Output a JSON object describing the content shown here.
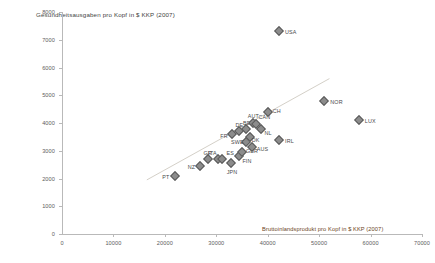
{
  "chart_data": {
    "type": "scatter",
    "title": "Gesundheitsausgaben pro Kopf in $ KKP (2007)",
    "xlabel": "Bruttoinlandsprodukt pro Kopf in $ KKP (2007)",
    "ylabel": "Gesundheitsausgaben pro Kopf in $ KKP (2007)",
    "xlim": [
      0,
      70000
    ],
    "ylim": [
      0,
      8000
    ],
    "xticks": [
      0,
      10000,
      20000,
      30000,
      40000,
      50000,
      60000,
      70000
    ],
    "yticks": [
      0,
      1000,
      2000,
      3000,
      4000,
      5000,
      6000,
      7000,
      8000
    ],
    "grid": false,
    "legend": "none",
    "marker": "diamond",
    "marker_color": "#8c8c8c",
    "trendline": {
      "visible": true,
      "x0": 16500,
      "y0": 1950,
      "x1": 52000,
      "y1": 5600,
      "color": "#d4d0c8"
    },
    "points": [
      {
        "label": "PT",
        "x": 22000,
        "y": 2100
      },
      {
        "label": "NZ",
        "x": 26800,
        "y": 2450
      },
      {
        "label": "GR",
        "x": 28300,
        "y": 2700
      },
      {
        "label": "ITA",
        "x": 30400,
        "y": 2700
      },
      {
        "label": "ES",
        "x": 31200,
        "y": 2700
      },
      {
        "label": "JPN",
        "x": 32800,
        "y": 2550
      },
      {
        "label": "FIN",
        "x": 34500,
        "y": 2800
      },
      {
        "label": "GBR",
        "x": 35000,
        "y": 2950
      },
      {
        "label": "SWE",
        "x": 35800,
        "y": 3300
      },
      {
        "label": "FR",
        "x": 33100,
        "y": 3600
      },
      {
        "label": "DE",
        "x": 34500,
        "y": 3700
      },
      {
        "label": "BE",
        "x": 35800,
        "y": 3800
      },
      {
        "label": "DK",
        "x": 36500,
        "y": 3500
      },
      {
        "label": "AUS",
        "x": 36900,
        "y": 3150
      },
      {
        "label": "AUT",
        "x": 37100,
        "y": 4000
      },
      {
        "label": "CAN",
        "x": 37800,
        "y": 3950
      },
      {
        "label": "NL",
        "x": 38600,
        "y": 3800
      },
      {
        "label": "CH",
        "x": 40000,
        "y": 4400
      },
      {
        "label": "USA",
        "x": 42200,
        "y": 7300
      },
      {
        "label": "IRL",
        "x": 42200,
        "y": 3400
      },
      {
        "label": "NOR",
        "x": 51000,
        "y": 4800
      },
      {
        "label": "LUX",
        "x": 57700,
        "y": 4100
      }
    ],
    "label_offsets": {
      "PT": [
        -13,
        1
      ],
      "NZ": [
        -12,
        1
      ],
      "GR": [
        -4,
        -6
      ],
      "ITA": [
        -10,
        -6
      ],
      "ES": [
        4,
        -6
      ],
      "JPN": [
        -4,
        9
      ],
      "FIN": [
        3,
        5
      ],
      "GBR": [
        4,
        -1
      ],
      "SWE": [
        -15,
        0
      ],
      "FR": [
        -12,
        2
      ],
      "DE": [
        -4,
        -6
      ],
      "BE": [
        -3,
        -6
      ],
      "DK": [
        2,
        3
      ],
      "AUS": [
        5,
        2
      ],
      "AUT": [
        -5,
        -7
      ],
      "CAN": [
        2,
        -7
      ],
      "NL": [
        4,
        4
      ],
      "CH": [
        5,
        -1
      ],
      "USA": [
        6,
        1
      ],
      "IRL": [
        6,
        1
      ],
      "NOR": [
        6,
        1
      ],
      "LUX": [
        6,
        1
      ]
    }
  }
}
